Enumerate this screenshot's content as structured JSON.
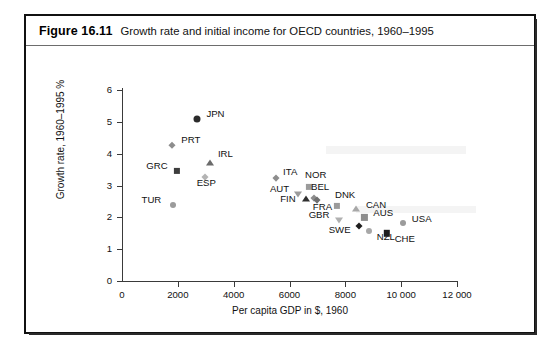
{
  "figure": {
    "number": "Figure 16.11",
    "caption": "Growth rate and initial income for OECD countries, 1960–1995"
  },
  "chart_data": {
    "type": "scatter",
    "title": "Growth rate and initial income for OECD countries, 1960–1995",
    "xlabel": "Per capita GDP in $, 1960",
    "ylabel": "Growth rate, 1960–1995 %",
    "xlim": [
      0,
      12000
    ],
    "ylim": [
      0,
      6
    ],
    "xticks": [
      0,
      2000,
      4000,
      6000,
      8000,
      10000,
      12000
    ],
    "xtick_labels": [
      "0",
      "2000",
      "4000",
      "6000",
      "8000",
      "10 000",
      "12 000"
    ],
    "yticks": [
      0,
      1,
      2,
      3,
      4,
      5,
      6
    ],
    "ytick_labels": [
      "0",
      "1",
      "2",
      "3",
      "4",
      "5",
      "6"
    ],
    "grid": false,
    "legend": "none",
    "points": [
      {
        "label": "JPN",
        "x": 2700,
        "y": 5.1,
        "marker": "circle",
        "color": "#2b2b2b",
        "size": 7.0,
        "lx": 9,
        "ly": -5
      },
      {
        "label": "PRT",
        "x": 1800,
        "y": 4.27,
        "marker": "diamond",
        "color": "#8d8d8d",
        "size": 6.2,
        "lx": 9,
        "ly": -5
      },
      {
        "label": "IRL",
        "x": 3150,
        "y": 3.72,
        "marker": "tri",
        "color": "#6b6b6b",
        "size": 7.2,
        "lx": 8,
        "ly": -9
      },
      {
        "label": "GRC",
        "x": 1980,
        "y": 3.45,
        "marker": "square",
        "color": "#3d3d3d",
        "size": 6.2,
        "lx": -31,
        "ly": -5
      },
      {
        "label": "ESP",
        "x": 2960,
        "y": 3.26,
        "marker": "diamond",
        "color": "#b4b4b4",
        "size": 6.4,
        "lx": -8,
        "ly": 6
      },
      {
        "label": "TUR",
        "x": 1810,
        "y": 2.4,
        "marker": "circle",
        "color": "#9b9b9b",
        "size": 6.0,
        "lx": -31,
        "ly": -5
      },
      {
        "label": "ITA",
        "x": 5520,
        "y": 3.22,
        "marker": "diamond",
        "color": "#8d8d8d",
        "size": 6.4,
        "lx": 7,
        "ly": -6
      },
      {
        "label": "NOR",
        "x": 6700,
        "y": 2.95,
        "marker": "square",
        "color": "#9b9b9b",
        "size": 6.2,
        "lx": -4,
        "ly": -12
      },
      {
        "label": "AUT",
        "x": 6300,
        "y": 2.72,
        "marker": "tridown",
        "color": "#9b9b9b",
        "size": 7.0,
        "lx": -28,
        "ly": -5
      },
      {
        "label": "BEL",
        "x": 6880,
        "y": 2.62,
        "marker": "diamond",
        "color": "#8d8d8d",
        "size": 6.4,
        "lx": -3,
        "ly": -11
      },
      {
        "label": "FIN",
        "x": 6600,
        "y": 2.58,
        "marker": "tri",
        "color": "#2f2f2f",
        "size": 7.2,
        "lx": -26,
        "ly": 0
      },
      {
        "label": "FRA",
        "x": 6980,
        "y": 2.55,
        "marker": "diamond",
        "color": "#6f6f6f",
        "size": 6.4,
        "lx": -4,
        "ly": 7
      },
      {
        "label": "DNK",
        "x": 7700,
        "y": 2.35,
        "marker": "square",
        "color": "#9b9b9b",
        "size": 6.2,
        "lx": -2,
        "ly": -11
      },
      {
        "label": "CAN",
        "x": 8380,
        "y": 2.25,
        "marker": "tri",
        "color": "#a8a8a8",
        "size": 7.2,
        "lx": 10,
        "ly": -4
      },
      {
        "label": "GBR",
        "x": 7760,
        "y": 1.93,
        "marker": "tridown",
        "color": "#b0b0b0",
        "size": 7.0,
        "lx": -30,
        "ly": -5
      },
      {
        "label": "AUS",
        "x": 8680,
        "y": 2.0,
        "marker": "square",
        "color": "#8d8d8d",
        "size": 6.2,
        "lx": 9,
        "ly": -4
      },
      {
        "label": "SWE",
        "x": 8480,
        "y": 1.72,
        "marker": "diamond",
        "color": "#1e1e1e",
        "size": 6.6,
        "lx": -30,
        "ly": 4
      },
      {
        "label": "NZL",
        "x": 8840,
        "y": 1.58,
        "marker": "circle",
        "color": "#a8a8a8",
        "size": 6.0,
        "lx": 8,
        "ly": 6
      },
      {
        "label": "USA",
        "x": 10060,
        "y": 1.82,
        "marker": "circle",
        "color": "#9b9b9b",
        "size": 6.0,
        "lx": 9,
        "ly": -4
      },
      {
        "label": "CHE",
        "x": 9480,
        "y": 1.5,
        "marker": "square",
        "color": "#1e1e1e",
        "size": 6.4,
        "lx": 8,
        "ly": 6
      }
    ]
  }
}
